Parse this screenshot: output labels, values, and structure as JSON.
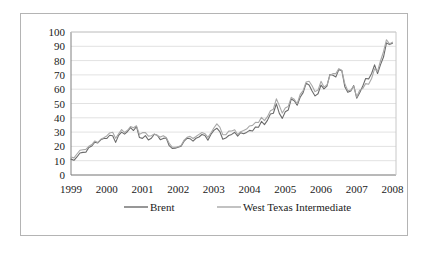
{
  "chart_data": {
    "type": "line",
    "title": "",
    "xlabel": "",
    "ylabel": "",
    "xlim": [
      1999,
      2008.1
    ],
    "ylim": [
      0,
      100
    ],
    "grid": true,
    "grid_axis": "y",
    "legend_position": "bottom",
    "x_tick_labels": [
      "1999",
      "2000",
      "2001",
      "2002",
      "2003",
      "2004",
      "2005",
      "2006",
      "2007",
      "2008"
    ],
    "x_tick_values": [
      1999,
      2000,
      2001,
      2002,
      2003,
      2004,
      2005,
      2006,
      2007,
      2008
    ],
    "y_tick_labels": [
      "0",
      "10",
      "20",
      "30",
      "40",
      "50",
      "60",
      "70",
      "80",
      "90",
      "100"
    ],
    "y_tick_values": [
      0,
      10,
      20,
      30,
      40,
      50,
      60,
      70,
      80,
      90,
      100
    ],
    "x_start": 1999.0,
    "x_step": 0.08333333,
    "series": [
      {
        "name": "Brent",
        "color": "#6b6b6b",
        "values": [
          11.1,
          10.3,
          12.6,
          15.4,
          15.8,
          15.9,
          19.3,
          20.3,
          22.9,
          22.4,
          24.6,
          25.5,
          25.5,
          27.8,
          27.5,
          22.8,
          27.7,
          30.0,
          28.6,
          30.4,
          33.1,
          31.1,
          33.8,
          26.2,
          25.6,
          27.5,
          24.5,
          25.7,
          28.5,
          27.8,
          24.7,
          25.6,
          25.9,
          20.5,
          18.6,
          18.7,
          19.5,
          20.2,
          23.7,
          25.7,
          25.4,
          23.7,
          25.7,
          26.6,
          28.3,
          27.6,
          24.3,
          28.4,
          31.2,
          32.7,
          30.4,
          25.0,
          25.8,
          27.6,
          28.4,
          29.9,
          27.2,
          29.6,
          28.8,
          29.8,
          31.2,
          30.8,
          33.6,
          33.4,
          37.5,
          35.2,
          38.2,
          42.7,
          43.2,
          49.8,
          43.1,
          39.6,
          44.2,
          45.5,
          53.1,
          51.9,
          48.8,
          54.4,
          57.6,
          64.1,
          62.9,
          58.7,
          55.3,
          56.8,
          62.9,
          60.2,
          62.1,
          70.3,
          69.8,
          68.6,
          73.7,
          73.0,
          61.8,
          57.8,
          58.8,
          62.5,
          53.7,
          57.5,
          62.0,
          67.5,
          67.2,
          71.0,
          77.0,
          71.0,
          77.2,
          82.5,
          92.4,
          91.2,
          92.2
        ]
      },
      {
        "name": "West Texas Intermediate",
        "color": "#a8a8a8",
        "values": [
          12.5,
          12.0,
          14.7,
          17.3,
          17.7,
          17.9,
          20.1,
          21.3,
          23.8,
          22.7,
          25.0,
          26.1,
          27.3,
          29.4,
          29.9,
          25.7,
          28.8,
          31.8,
          29.7,
          31.3,
          33.9,
          33.0,
          34.4,
          28.4,
          29.6,
          29.6,
          27.2,
          27.5,
          28.6,
          27.6,
          26.5,
          27.5,
          26.2,
          22.2,
          19.6,
          19.3,
          19.7,
          20.7,
          24.4,
          26.3,
          27.0,
          25.5,
          26.9,
          28.4,
          29.7,
          28.9,
          26.3,
          29.4,
          32.9,
          35.8,
          33.5,
          28.2,
          28.1,
          30.7,
          30.8,
          31.6,
          28.3,
          30.3,
          31.1,
          32.1,
          34.3,
          34.7,
          36.8,
          36.7,
          40.3,
          38.0,
          40.8,
          44.9,
          46.0,
          53.3,
          48.5,
          43.3,
          46.8,
          48.0,
          54.3,
          53.0,
          49.8,
          56.4,
          59.0,
          65.0,
          65.6,
          62.4,
          58.3,
          59.4,
          65.5,
          61.6,
          62.9,
          69.7,
          70.9,
          70.9,
          74.4,
          73.1,
          63.9,
          58.9,
          59.4,
          62.0,
          54.5,
          59.3,
          60.4,
          63.9,
          63.5,
          67.5,
          74.2,
          72.4,
          79.9,
          86.2,
          94.6,
          91.7,
          92.9
        ]
      }
    ]
  },
  "legend": {
    "items": [
      {
        "label": "Brent",
        "color": "#6b6b6b"
      },
      {
        "label": "West Texas Intermediate",
        "color": "#a8a8a8"
      }
    ]
  },
  "style": {
    "frame_border_color": "#b4b4b4",
    "plot_border_color": "#c8c8c8",
    "grid_color": "#e2e2e2",
    "axis_color": "#808080",
    "text_color": "#1a1a1a",
    "background": "#ffffff"
  }
}
